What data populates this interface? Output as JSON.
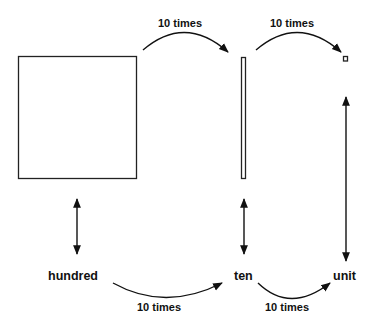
{
  "diagram": {
    "title": "",
    "blocks": [
      {
        "id": "hundred",
        "shape": "large-square",
        "label": "hundred"
      },
      {
        "id": "ten",
        "shape": "thin-bar",
        "label": "ten"
      },
      {
        "id": "unit",
        "shape": "small-square",
        "label": "unit"
      }
    ],
    "labels": {
      "hundred": "hundred",
      "ten": "ten",
      "unit": "unit"
    },
    "arrows": {
      "top_hundred_to_ten": "10 times",
      "top_ten_to_unit": "10 times",
      "bottom_hundred_to_ten": "10 times",
      "bottom_ten_to_unit": "10 times"
    },
    "colors": {
      "stroke": "#111111",
      "background": "#ffffff"
    }
  }
}
